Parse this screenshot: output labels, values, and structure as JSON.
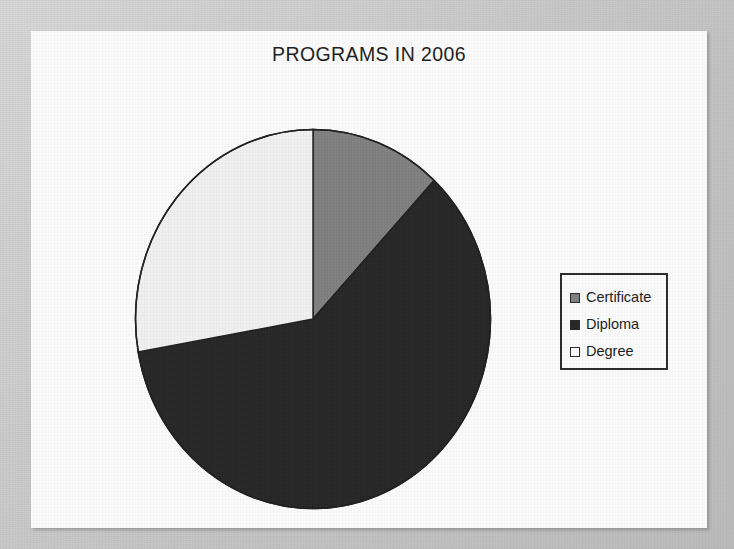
{
  "page": {
    "background_color": "#c9c9c9",
    "canvas_color": "#fdfdfd"
  },
  "chart_data": {
    "type": "pie",
    "title": "PROGRAMS IN 2006",
    "xlabel": "",
    "ylabel": "",
    "grid": false,
    "legend_position": "right",
    "start_angle_deg": 0,
    "direction": "clockwise",
    "categories": [
      "Certificate",
      "Diploma",
      "Degree"
    ],
    "values": [
      12,
      60,
      28
    ],
    "units": "percent",
    "slices": [
      {
        "label": "Certificate",
        "value": 12,
        "percent": 12,
        "start_angle_deg": 0,
        "end_angle_deg": 43,
        "color": "#808080"
      },
      {
        "label": "Diploma",
        "value": 60,
        "percent": 60,
        "start_angle_deg": 43,
        "end_angle_deg": 260,
        "color": "#262626"
      },
      {
        "label": "Degree",
        "value": 28,
        "percent": 28,
        "start_angle_deg": 260,
        "end_angle_deg": 360,
        "color": "#f2f2f2"
      }
    ]
  },
  "legend": {
    "items": [
      {
        "label": "Certificate",
        "color": "#808080"
      },
      {
        "label": "Diploma",
        "color": "#262626"
      },
      {
        "label": "Degree",
        "color": "#fdfdfd"
      }
    ]
  }
}
